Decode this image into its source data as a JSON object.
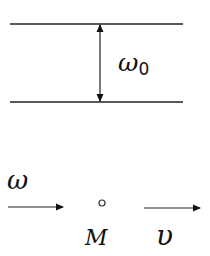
{
  "diagram": {
    "type": "physics-schematic",
    "top_section": {
      "upper_line": {
        "x1": 10,
        "x2": 183,
        "y": 24
      },
      "lower_line": {
        "x1": 10,
        "x2": 183,
        "y": 102
      },
      "gap_arrow": {
        "x": 100,
        "y1": 24,
        "y2": 102,
        "style": "double-headed"
      },
      "gap_label": {
        "symbol": "ω",
        "subscript": "0",
        "text": "ω0"
      }
    },
    "bottom_section": {
      "incoming_arrow": {
        "x1": 8,
        "x2": 63,
        "y": 207,
        "label": "ω"
      },
      "point": {
        "cx": 102,
        "cy": 203,
        "label": "M"
      },
      "velocity_arrow": {
        "x1": 144,
        "x2": 200,
        "y": 208,
        "label": "υ"
      }
    },
    "colors": {
      "stroke": "#222222",
      "background": "#ffffff"
    }
  }
}
